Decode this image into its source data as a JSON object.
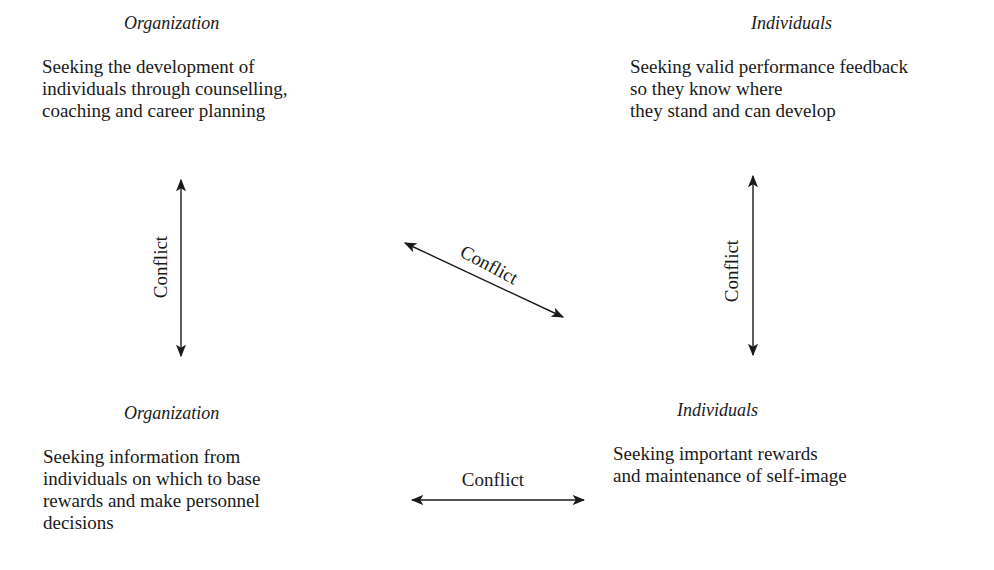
{
  "quadrants": {
    "top_left": {
      "heading": "Organization",
      "lines": [
        "Seeking the development of",
        "individuals through counselling,",
        "coaching and career planning"
      ]
    },
    "top_right": {
      "heading": "Individuals",
      "lines": [
        "Seeking valid performance feedback",
        "so they know where",
        "they stand and can develop"
      ]
    },
    "bottom_left": {
      "heading": "Organization",
      "lines": [
        "Seeking information from",
        "individuals on which to base",
        "rewards and make personnel",
        "decisions"
      ]
    },
    "bottom_right": {
      "heading": "Individuals",
      "lines": [
        "Seeking important rewards",
        "and maintenance of self-image"
      ]
    }
  },
  "connectors": {
    "left_vertical": "Conflict",
    "right_vertical": "Conflict",
    "diagonal": "Conflict",
    "bottom_horizontal": "Conflict"
  },
  "colors": {
    "ink": "#1a1a1a",
    "background": "#ffffff"
  }
}
